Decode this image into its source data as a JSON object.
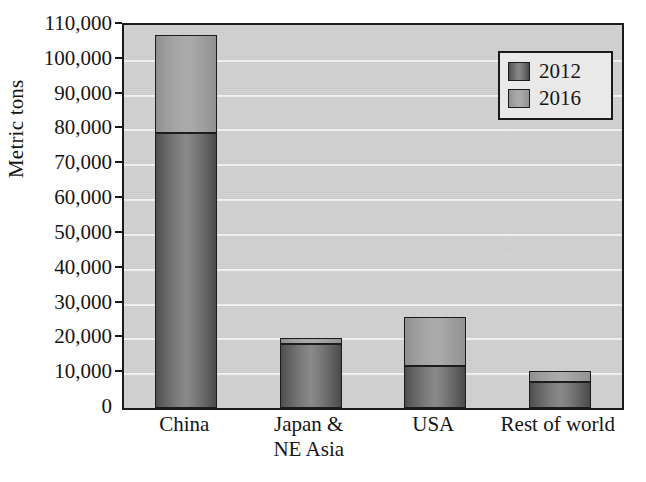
{
  "chart_data": {
    "type": "bar",
    "subtype": "stacked-vertical",
    "title": "",
    "xlabel": "",
    "ylabel": "Metric tons",
    "categories": [
      "China",
      "Japan & NE Asia",
      "USA",
      "Rest of world"
    ],
    "category_labels": [
      {
        "line1": "China",
        "line2": ""
      },
      {
        "line1": "Japan &",
        "line2": "NE Asia"
      },
      {
        "line1": "USA",
        "line2": ""
      },
      {
        "line1": "Rest of world",
        "line2": ""
      }
    ],
    "series": [
      {
        "name": "2012",
        "color": "#6d6d6d",
        "values": [
          79000,
          18500,
          12000,
          7500
        ]
      },
      {
        "name": "2016",
        "color": "#a2a2a2",
        "values": [
          28000,
          1500,
          14000,
          3000
        ]
      }
    ],
    "totals": [
      107000,
      20000,
      26000,
      10500
    ],
    "ylim": [
      0,
      110000
    ],
    "ytick_values": [
      0,
      10000,
      20000,
      30000,
      40000,
      50000,
      60000,
      70000,
      80000,
      90000,
      100000,
      110000
    ],
    "ytick_labels": [
      "0",
      "10,000",
      "20,000",
      "30,000",
      "40,000",
      "50,000",
      "60,000",
      "70,000",
      "80,000",
      "90,000",
      "100,000",
      "110,000"
    ],
    "grid": true,
    "gridline_color": "#f4f4f4",
    "plot_background": "#d3d3d3",
    "axis_color": "#1a1a1a",
    "legend": {
      "position": "top-right",
      "entries": [
        {
          "label": "2012",
          "color": "#6d6d6d"
        },
        {
          "label": "2016",
          "color": "#a2a2a2"
        }
      ]
    }
  }
}
